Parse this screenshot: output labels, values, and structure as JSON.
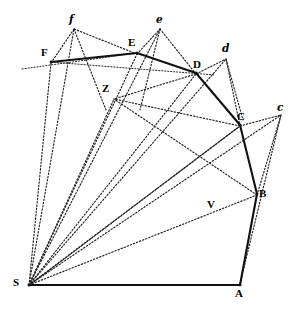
{
  "figure": {
    "canvas": {
      "width": 298,
      "height": 310
    },
    "background_color": "#ffffff",
    "ink_color": "#111111"
  },
  "labels": {
    "S": "S",
    "A": "A",
    "B": "B",
    "C": "C",
    "D": "D",
    "E": "E",
    "F": "F",
    "V": "V",
    "Z": "Z",
    "c_script": "c",
    "d_script": "d",
    "e_script": "e",
    "f_script": "f"
  },
  "points": {
    "S": {
      "x": 29,
      "y": 285,
      "label": "S",
      "label_x": 13,
      "label_y": 288
    },
    "A": {
      "x": 240,
      "y": 285,
      "label": "A",
      "label_x": 236,
      "label_y": 289
    },
    "B": {
      "x": 257,
      "y": 194,
      "label": "B",
      "label_x": 259,
      "label_y": 193
    },
    "C": {
      "x": 240,
      "y": 125,
      "label": "C",
      "label_x": 238,
      "label_y": 113
    },
    "D": {
      "x": 196,
      "y": 73,
      "label": "D",
      "label_x": 194,
      "label_y": 61
    },
    "E": {
      "x": 137,
      "y": 53,
      "label": "E",
      "label_x": 128,
      "label_y": 39
    },
    "F": {
      "x": 51,
      "y": 62,
      "label": "F",
      "label_x": 42,
      "label_y": 49
    },
    "V": {
      "x": 216,
      "y": 209,
      "label": "V",
      "label_x": 208,
      "label_y": 201
    },
    "Z": {
      "x": 114,
      "y": 98,
      "label": "Z",
      "label_x": 103,
      "label_y": 85
    },
    "c": {
      "x": 281,
      "y": 114,
      "label": "c",
      "label_x": 278,
      "label_y": 105
    },
    "d": {
      "x": 226,
      "y": 58,
      "label": "d",
      "label_x": 223,
      "label_y": 46
    },
    "e": {
      "x": 160,
      "y": 28,
      "label": "e",
      "label_x": 156,
      "label_y": 17
    },
    "f": {
      "x": 74,
      "y": 28,
      "label": "f",
      "label_x": 70,
      "label_y": 17
    }
  },
  "segments": {
    "orbit_polygon": [
      {
        "name": "S-A",
        "from": "S",
        "to": "A",
        "style": "solid"
      },
      {
        "name": "A-B",
        "from": "A",
        "to": "B",
        "style": "solid"
      },
      {
        "name": "B-C",
        "from": "B",
        "to": "C",
        "style": "solid"
      },
      {
        "name": "C-D",
        "from": "C",
        "to": "D",
        "style": "solid"
      },
      {
        "name": "D-E",
        "from": "D",
        "to": "E",
        "style": "solid"
      },
      {
        "name": "E-F",
        "from": "E",
        "to": "F",
        "style": "solid"
      }
    ],
    "radii_from_S": [
      {
        "name": "S-B",
        "from": "S",
        "to": "B",
        "style": "dotted"
      },
      {
        "name": "S-C",
        "from": "S",
        "to": "C",
        "style": "dotted"
      },
      {
        "name": "S-D",
        "from": "S",
        "to": "D",
        "style": "dotted"
      },
      {
        "name": "S-E",
        "from": "S",
        "to": "E",
        "style": "dotted"
      },
      {
        "name": "S-F",
        "from": "S",
        "to": "F",
        "style": "dotted"
      },
      {
        "name": "S-c",
        "from": "S",
        "to": "c",
        "style": "dotted"
      },
      {
        "name": "S-d",
        "from": "S",
        "to": "d",
        "style": "dotted"
      },
      {
        "name": "S-e",
        "from": "S",
        "to": "e",
        "style": "dotted"
      },
      {
        "name": "S-f",
        "from": "S",
        "to": "f",
        "style": "dotted"
      },
      {
        "name": "S-Z",
        "from": "S",
        "to": "Z",
        "style": "dotted"
      },
      {
        "name": "S-V",
        "from": "S",
        "to": "V",
        "style": "dotted"
      }
    ],
    "tangent_extensions": [
      {
        "name": "B-c",
        "from": "B",
        "to": "c",
        "style": "dotted"
      },
      {
        "name": "C-c",
        "from": "C",
        "to": "c",
        "style": "dotted"
      },
      {
        "name": "C-d",
        "from": "C",
        "to": "d",
        "style": "dotted"
      },
      {
        "name": "D-d",
        "from": "D",
        "to": "d",
        "style": "dotted"
      },
      {
        "name": "D-e",
        "from": "D",
        "to": "e",
        "style": "dotted"
      },
      {
        "name": "E-e",
        "from": "E",
        "to": "e",
        "style": "dotted"
      },
      {
        "name": "E-f",
        "from": "E",
        "to": "f",
        "style": "dotted"
      },
      {
        "name": "F-f",
        "from": "F",
        "to": "f",
        "style": "dotted"
      },
      {
        "name": "A-V-c",
        "from": "A",
        "to": "c",
        "style": "dotted"
      },
      {
        "name": "B-V-Z",
        "from": "B",
        "to": "Z",
        "style": "dotted"
      },
      {
        "name": "C-Z",
        "from": "C",
        "to": "Z",
        "style": "dotted"
      },
      {
        "name": "D-Z",
        "from": "D",
        "to": "Z",
        "style": "dotted"
      },
      {
        "name": "F-extension-left",
        "from": "F",
        "to": "left-edge",
        "style": "solid-thin"
      }
    ]
  }
}
